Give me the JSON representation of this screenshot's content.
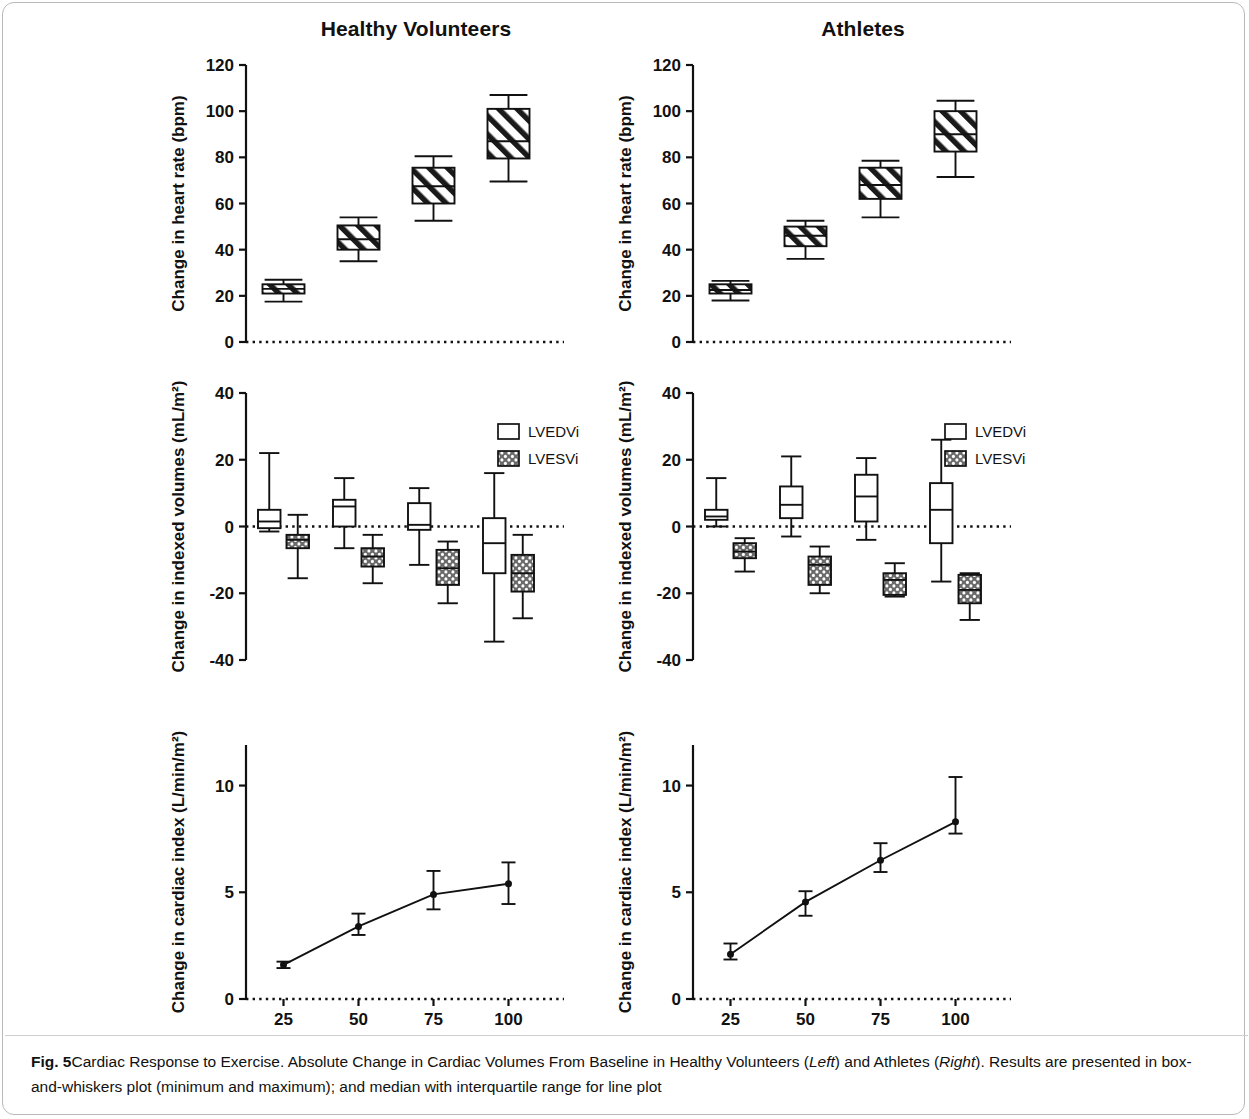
{
  "figure": {
    "label": "Fig. 5",
    "caption_part1": "Cardiac Response to Exercise. Absolute Change in Cardiac Volumes From Baseline in Healthy Volunteers (",
    "caption_em1": "Left",
    "caption_part2": ") and Athletes (",
    "caption_em2": "Right",
    "caption_part3": "). Results are presented in box-and-whiskers plot (minimum and maximum); and median with interquartile range for line plot"
  },
  "columns": [
    {
      "title": "Healthy Volunteers"
    },
    {
      "title": "Athletes"
    }
  ],
  "legend": {
    "items": [
      {
        "label": "LVEDVi",
        "pattern": "open"
      },
      {
        "label": "LVESVi",
        "pattern": "checker"
      }
    ]
  },
  "axes": {
    "hr_ylabel": "Change in heart rate (bpm)",
    "vol_ylabel": "Change in indexed volumes (mL/m²)",
    "ci_ylabel": "Change in cardiac index (L/min/m²)",
    "xlabel": "Peak heart rate (%)",
    "hr_ticks": [
      "0",
      "20",
      "40",
      "60",
      "80",
      "100",
      "120"
    ],
    "vol_ticks": [
      "-40",
      "-20",
      "0",
      "20",
      "40"
    ],
    "ci_ticks": [
      "0",
      "5",
      "10"
    ],
    "x_ticks": [
      "25",
      "50",
      "75",
      "100"
    ]
  },
  "chart_data": [
    {
      "type": "box",
      "id": "hr-healthy",
      "title": "Healthy Volunteers",
      "ylabel": "Change in heart rate (bpm)",
      "xlabel": "",
      "categories": [
        "25",
        "50",
        "75",
        "100"
      ],
      "ylim": [
        0,
        120
      ],
      "grid": false,
      "series": [
        {
          "name": "Change in heart rate",
          "boxes": [
            {
              "category": "25",
              "min": 17.5,
              "q1": 21.0,
              "median": 23.0,
              "q3": 25.0,
              "max": 27.0
            },
            {
              "category": "50",
              "min": 35.0,
              "q1": 40.0,
              "median": 44.5,
              "q3": 50.5,
              "max": 54.0
            },
            {
              "category": "75",
              "min": 52.5,
              "q1": 60.0,
              "median": 67.5,
              "q3": 75.5,
              "max": 80.5
            },
            {
              "category": "100",
              "min": 69.5,
              "q1": 79.5,
              "median": 87.0,
              "q3": 101.0,
              "max": 107.0
            }
          ]
        }
      ]
    },
    {
      "type": "box",
      "id": "hr-athletes",
      "title": "Athletes",
      "ylabel": "Change in heart rate (bpm)",
      "xlabel": "",
      "categories": [
        "25",
        "50",
        "75",
        "100"
      ],
      "ylim": [
        0,
        120
      ],
      "grid": false,
      "series": [
        {
          "name": "Change in heart rate",
          "boxes": [
            {
              "category": "25",
              "min": 18.0,
              "q1": 21.0,
              "median": 22.5,
              "q3": 25.0,
              "max": 26.5
            },
            {
              "category": "50",
              "min": 36.0,
              "q1": 41.5,
              "median": 46.0,
              "q3": 50.0,
              "max": 52.5
            },
            {
              "category": "75",
              "min": 54.0,
              "q1": 62.0,
              "median": 68.0,
              "q3": 75.5,
              "max": 78.5
            },
            {
              "category": "100",
              "min": 71.5,
              "q1": 82.5,
              "median": 90.0,
              "q3": 100.0,
              "max": 104.5
            }
          ]
        }
      ]
    },
    {
      "type": "box",
      "id": "vol-healthy",
      "title": "Healthy Volunteers",
      "ylabel": "Change in indexed volumes (mL/m²)",
      "xlabel": "",
      "categories": [
        "25",
        "50",
        "75",
        "100"
      ],
      "ylim": [
        -40,
        40
      ],
      "grid": false,
      "series": [
        {
          "name": "LVEDVi",
          "pattern": "open",
          "boxes": [
            {
              "category": "25",
              "min": -1.5,
              "q1": -0.5,
              "median": 1.5,
              "q3": 5.0,
              "max": 22.0
            },
            {
              "category": "50",
              "min": -6.5,
              "q1": 0.0,
              "median": 6.0,
              "q3": 8.0,
              "max": 14.5
            },
            {
              "category": "75",
              "min": -11.5,
              "q1": -1.0,
              "median": 0.5,
              "q3": 7.0,
              "max": 11.5
            },
            {
              "category": "100",
              "min": -34.5,
              "q1": -14.0,
              "median": -5.0,
              "q3": 2.5,
              "max": 16.0
            }
          ]
        },
        {
          "name": "LVESVi",
          "pattern": "checker",
          "boxes": [
            {
              "category": "25",
              "min": -15.5,
              "q1": -6.5,
              "median": -4.0,
              "q3": -2.5,
              "max": 3.5
            },
            {
              "category": "50",
              "min": -17.0,
              "q1": -12.0,
              "median": -9.0,
              "q3": -6.5,
              "max": -2.5
            },
            {
              "category": "75",
              "min": -23.0,
              "q1": -17.5,
              "median": -12.5,
              "q3": -7.0,
              "max": -4.5
            },
            {
              "category": "100",
              "min": -27.5,
              "q1": -19.5,
              "median": -14.0,
              "q3": -8.5,
              "max": -2.5
            }
          ]
        }
      ]
    },
    {
      "type": "box",
      "id": "vol-athletes",
      "title": "Athletes",
      "ylabel": "Change in indexed volumes (mL/m²)",
      "xlabel": "",
      "categories": [
        "25",
        "50",
        "75",
        "100"
      ],
      "ylim": [
        -40,
        40
      ],
      "grid": false,
      "series": [
        {
          "name": "LVEDVi",
          "pattern": "open",
          "boxes": [
            {
              "category": "25",
              "min": 0.0,
              "q1": 2.0,
              "median": 3.0,
              "q3": 5.0,
              "max": 14.5
            },
            {
              "category": "50",
              "min": -3.0,
              "q1": 2.5,
              "median": 6.5,
              "q3": 12.0,
              "max": 21.0
            },
            {
              "category": "75",
              "min": -4.0,
              "q1": 1.5,
              "median": 9.0,
              "q3": 15.5,
              "max": 20.5
            },
            {
              "category": "100",
              "min": -16.5,
              "q1": -5.0,
              "median": 5.0,
              "q3": 13.0,
              "max": 26.0
            }
          ]
        },
        {
          "name": "LVESVi",
          "pattern": "checker",
          "boxes": [
            {
              "category": "25",
              "min": -13.5,
              "q1": -9.5,
              "median": -7.5,
              "q3": -5.0,
              "max": -3.5
            },
            {
              "category": "50",
              "min": -20.0,
              "q1": -17.5,
              "median": -11.5,
              "q3": -9.0,
              "max": -6.0
            },
            {
              "category": "75",
              "min": -21.0,
              "q1": -20.5,
              "median": -16.0,
              "q3": -14.0,
              "max": -11.0
            },
            {
              "category": "100",
              "min": -28.0,
              "q1": -23.0,
              "median": -19.0,
              "q3": -14.5,
              "max": -14.0
            }
          ]
        }
      ]
    },
    {
      "type": "line",
      "id": "ci-healthy",
      "title": "Healthy Volunteers",
      "ylabel": "Change in cardiac index (L/min/m²)",
      "xlabel": "Peak heart rate (%)",
      "x": [
        25,
        50,
        75,
        100
      ],
      "ylim": [
        0,
        12
      ],
      "grid": false,
      "series": [
        {
          "name": "Change in cardiac index",
          "values": [
            1.6,
            3.4,
            4.9,
            5.4
          ],
          "err_low": [
            1.45,
            3.0,
            4.2,
            4.45
          ],
          "err_high": [
            1.75,
            4.0,
            6.0,
            6.4
          ]
        }
      ]
    },
    {
      "type": "line",
      "id": "ci-athletes",
      "title": "Athletes",
      "ylabel": "Change in cardiac index (L/min/m²)",
      "xlabel": "Peak heart rate (%)",
      "x": [
        25,
        50,
        75,
        100
      ],
      "ylim": [
        0,
        12
      ],
      "grid": false,
      "series": [
        {
          "name": "Change in cardiac index",
          "values": [
            2.1,
            4.55,
            6.5,
            8.3
          ],
          "err_low": [
            1.85,
            3.9,
            5.95,
            7.75
          ],
          "err_high": [
            2.6,
            5.05,
            7.3,
            10.4
          ]
        }
      ]
    }
  ]
}
